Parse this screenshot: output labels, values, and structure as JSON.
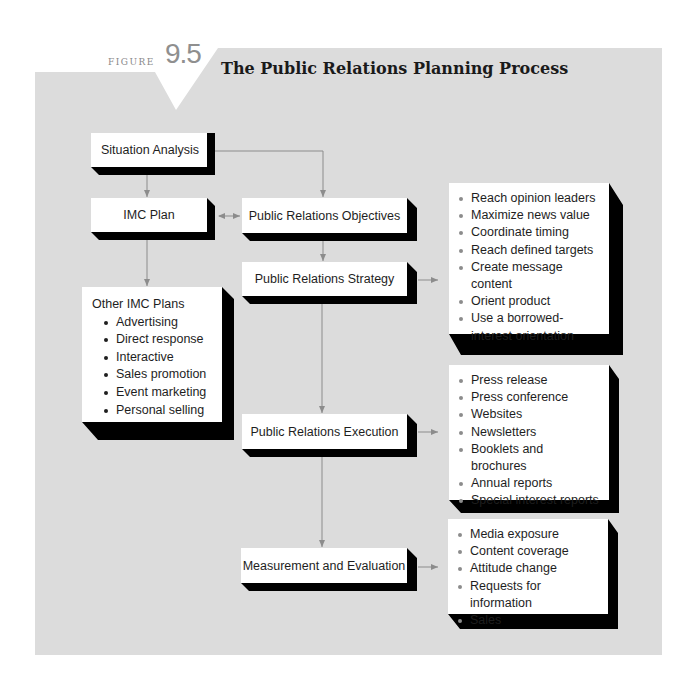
{
  "figure": {
    "label": "FIGURE",
    "number": "9.5",
    "title": "The Public Relations Planning Process"
  },
  "colors": {
    "panel_background": "#dcdcdc",
    "box_face": "#ffffff",
    "box_shadow": "#000000",
    "connector": "#8c8c8c",
    "figure_number": "#8f8f8f"
  },
  "nodes": {
    "situation_analysis": "Situation Analysis",
    "imc_plan": "IMC Plan",
    "pr_objectives": "Public Relations Objectives",
    "pr_strategy": "Public Relations Strategy",
    "pr_execution": "Public Relations Execution",
    "measurement": "Measurement and Evaluation",
    "other_imc": {
      "heading": "Other IMC Plans",
      "items": [
        "Advertising",
        "Direct response",
        "Interactive",
        "Sales promotion",
        "Event marketing",
        "Personal selling"
      ]
    }
  },
  "lists": {
    "strategy": [
      "Reach opinion leaders",
      "Maximize news value",
      "Coordinate timing",
      "Reach defined targets",
      "Create message content",
      "Orient product",
      "Use a borrowed-interest orientation"
    ],
    "execution": [
      "Press release",
      "Press conference",
      "Websites",
      "Newsletters",
      "Booklets and brochures",
      "Annual reports",
      "Special interest reports"
    ],
    "measurement": [
      "Media exposure",
      "Content coverage",
      "Attitude change",
      "Requests for information",
      "Sales"
    ]
  },
  "edges": [
    {
      "from": "situation_analysis",
      "to": "imc_plan"
    },
    {
      "from": "situation_analysis",
      "to": "pr_objectives"
    },
    {
      "from": "imc_plan",
      "to": "pr_objectives",
      "bidirectional": true
    },
    {
      "from": "imc_plan",
      "to": "other_imc"
    },
    {
      "from": "pr_objectives",
      "to": "pr_strategy"
    },
    {
      "from": "pr_strategy",
      "to": "strategy_list"
    },
    {
      "from": "pr_strategy",
      "to": "pr_execution"
    },
    {
      "from": "pr_execution",
      "to": "execution_list"
    },
    {
      "from": "pr_execution",
      "to": "measurement"
    },
    {
      "from": "measurement",
      "to": "measurement_list"
    }
  ]
}
